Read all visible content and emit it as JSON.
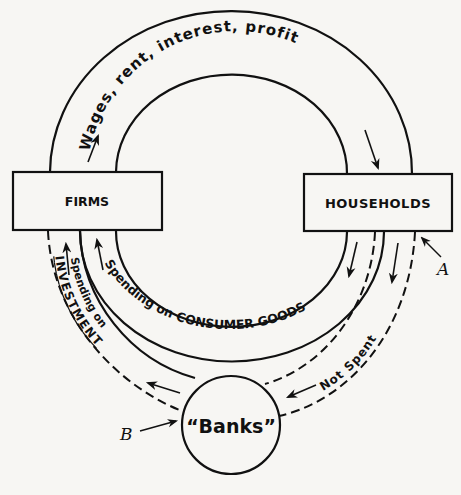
{
  "diagram": {
    "nodes": {
      "firms": "FIRMS",
      "households": "HOUSEHOLDS",
      "banks": "“Banks”"
    },
    "flows": {
      "income": "Wages, rent, interest, profit",
      "consumption": "Spending on CONSUMER GOODS",
      "saving": "Not Spent",
      "investment_line1": "Spending on",
      "investment_line2": "INVESTMENT"
    },
    "markers": {
      "a": "A",
      "b": "B"
    },
    "colors": {
      "ink": "#111111",
      "paper": "#f7f6f3"
    }
  }
}
